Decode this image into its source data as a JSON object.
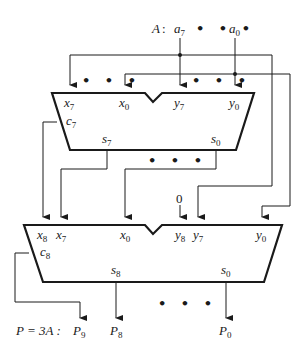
{
  "diagram": {
    "input": {
      "name": "A",
      "separator": ":",
      "msb": {
        "base": "a",
        "sub": "7"
      },
      "lsb": {
        "base": "a",
        "sub": "0"
      },
      "ellipsis": "• • •"
    },
    "adder_top": {
      "inputs_x": [
        {
          "base": "x",
          "sub": "7"
        },
        {
          "base": "x",
          "sub": "0"
        }
      ],
      "inputs_y": [
        {
          "base": "y",
          "sub": "7"
        },
        {
          "base": "y",
          "sub": "0"
        }
      ],
      "carry": {
        "base": "c",
        "sub": "7"
      },
      "sums": [
        {
          "base": "s",
          "sub": "7"
        },
        {
          "base": "s",
          "sub": "0"
        }
      ],
      "ellipsis_x": "• • •",
      "ellipsis_y": "• • •",
      "ellipsis_s": "• • •"
    },
    "adder_bottom": {
      "inputs_x": [
        {
          "base": "x",
          "sub": "8"
        },
        {
          "base": "x",
          "sub": "7"
        },
        {
          "base": "x",
          "sub": "0"
        }
      ],
      "inputs_y": [
        {
          "base": "y",
          "sub": "8"
        },
        {
          "base": "y",
          "sub": "7"
        },
        {
          "base": "y",
          "sub": "0"
        }
      ],
      "y8_constant": "0",
      "carry": {
        "base": "c",
        "sub": "8"
      },
      "sums": [
        {
          "base": "s",
          "sub": "8"
        },
        {
          "base": "s",
          "sub": "0"
        }
      ],
      "ellipsis_out": "• • •"
    },
    "output": {
      "expression": "P = 3A :",
      "bits": [
        {
          "base": "P",
          "sub": "9"
        },
        {
          "base": "P",
          "sub": "8"
        },
        {
          "base": "P",
          "sub": "0"
        }
      ]
    },
    "colors": {
      "line": "#1a1a1a",
      "background": "#ffffff"
    }
  }
}
